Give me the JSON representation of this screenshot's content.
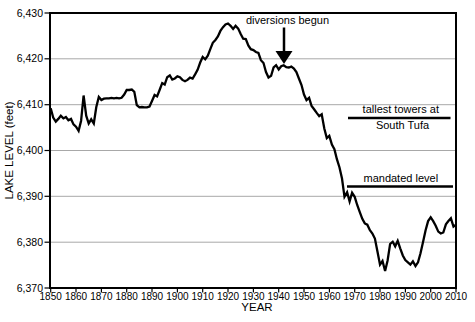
{
  "figure": {
    "background": "#ffffff",
    "ink_color": "#000000",
    "gridline_color": "#a8a8a8"
  },
  "chart_data": {
    "type": "line",
    "title": "",
    "xlabel": "YEAR",
    "ylabel": "LAKE LEVEL (feet)",
    "xlim": [
      1850,
      2010
    ],
    "ylim": [
      6370,
      6430
    ],
    "grid": "horizontal-only",
    "legend": "none",
    "line_color": "#000000",
    "xtick_labels": [
      "1850",
      "1860",
      "1870",
      "1880",
      "1890",
      "1900",
      "1910",
      "1920",
      "1930",
      "1940",
      "1950",
      "1960",
      "1970",
      "1980",
      "1990",
      "2000",
      "2010"
    ],
    "ytick_labels": [
      "6,430",
      "6,420",
      "6,410",
      "6,400",
      "6,390",
      "6,380",
      "6,370"
    ],
    "series": [
      {
        "name": "lake level",
        "x_start": 1850,
        "x_end": 2010,
        "x_step": 1,
        "values": [
          6409.2,
          6407.2,
          6406.3,
          6406.9,
          6407.6,
          6407.0,
          6407.3,
          6406.6,
          6406.9,
          6405.7,
          6405.2,
          6404.3,
          6406.5,
          6412.0,
          6407.6,
          6405.9,
          6406.8,
          6405.9,
          6409.5,
          6411.7,
          6411.0,
          6411.3,
          6411.4,
          6411.4,
          6411.5,
          6411.4,
          6411.5,
          6411.4,
          6411.5,
          6412.2,
          6413.2,
          6413.2,
          6413.3,
          6412.8,
          6409.9,
          6409.4,
          6409.5,
          6409.4,
          6409.4,
          6409.6,
          6410.8,
          6412.1,
          6411.8,
          6413.2,
          6414.7,
          6414.4,
          6416.0,
          6416.4,
          6415.5,
          6415.7,
          6416.2,
          6416.0,
          6415.4,
          6415.1,
          6415.4,
          6415.9,
          6415.7,
          6416.6,
          6417.6,
          6419.2,
          6420.4,
          6419.9,
          6420.7,
          6422.1,
          6423.5,
          6424.1,
          6424.9,
          6426.1,
          6426.9,
          6427.5,
          6427.7,
          6427.2,
          6426.5,
          6427.2,
          6426.6,
          6425.4,
          6424.4,
          6424.3,
          6422.9,
          6422.1,
          6421.9,
          6421.5,
          6421.3,
          6419.7,
          6419.1,
          6417.1,
          6415.9,
          6416.3,
          6418.1,
          6418.6,
          6417.7,
          6418.4,
          6418.6,
          6418.2,
          6418.1,
          6418.3,
          6417.9,
          6417.1,
          6415.7,
          6414.3,
          6412.2,
          6411.0,
          6411.5,
          6409.7,
          6409.0,
          6408.2,
          6407.5,
          6407.9,
          6404.8,
          6402.7,
          6403.2,
          6401.3,
          6400.3,
          6398.1,
          6396.3,
          6393.9,
          6389.9,
          6390.9,
          6388.9,
          6390.8,
          6389.9,
          6388.1,
          6386.6,
          6385.1,
          6384.1,
          6383.8,
          6382.6,
          6381.9,
          6380.8,
          6377.9,
          6375.1,
          6375.9,
          6373.7,
          6376.0,
          6379.6,
          6380.1,
          6379.1,
          6380.3,
          6378.6,
          6377.1,
          6376.1,
          6375.6,
          6375.1,
          6375.8,
          6374.8,
          6375.6,
          6377.6,
          6380.1,
          6382.6,
          6384.6,
          6385.4,
          6384.6,
          6383.6,
          6382.3,
          6381.9,
          6382.1,
          6383.9,
          6384.6,
          6385.2,
          6383.4,
          6383.8
        ]
      }
    ],
    "reference_lines": [
      {
        "label_lines": [
          "tallest towers at",
          "South Tufa"
        ],
        "level_feet": 6407,
        "year_start": 1967.5,
        "year_end": 2008
      },
      {
        "label_lines": [
          "mandated level"
        ],
        "level_feet": 6392,
        "year_start": 1967,
        "year_end": 2009
      }
    ],
    "annotations": [
      {
        "text": "diversions begun",
        "year": 1941,
        "level_feet": 6419,
        "arrow": "down"
      }
    ]
  }
}
